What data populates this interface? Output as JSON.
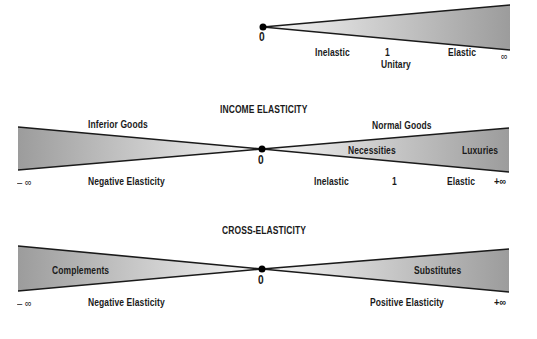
{
  "price": {
    "zero": "0",
    "inelastic": "Inelastic",
    "one": "1",
    "unitary": "Unitary",
    "elastic": "Elastic",
    "infinity": "∞"
  },
  "income": {
    "title": "INCOME ELASTICITY",
    "inferior_goods": "Inferior Goods",
    "normal_goods": "Normal Goods",
    "necessities": "Necessities",
    "luxuries": "Luxuries",
    "zero": "0",
    "neg_infinity": "– ∞",
    "pos_infinity": "+∞",
    "negative_elasticity": "Negative Elasticity",
    "inelastic": "Inelastic",
    "one": "1",
    "elastic": "Elastic"
  },
  "cross": {
    "title": "CROSS-ELASTICITY",
    "complements": "Complements",
    "substitutes": "Substitutes",
    "zero": "0",
    "neg_infinity": "– ∞",
    "pos_infinity": "+∞",
    "negative_elasticity": "Negative Elasticity",
    "positive_elasticity": "Positive Elasticity"
  },
  "colors": {
    "wedge_dark": "#9a9a9a",
    "wedge_light": "#f4f4f4",
    "line": "#1a1a1a"
  }
}
